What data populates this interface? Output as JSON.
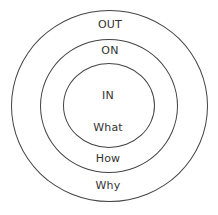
{
  "diagram": {
    "type": "concentric-circles",
    "stroke_color": "#444444",
    "text_color": "#333333",
    "rings": [
      {
        "name": "outer",
        "top_label": "OUT",
        "bottom_label": "Why"
      },
      {
        "name": "middle",
        "top_label": "ON",
        "bottom_label": "How"
      },
      {
        "name": "inner",
        "top_label": "IN",
        "bottom_label": "What"
      }
    ]
  }
}
